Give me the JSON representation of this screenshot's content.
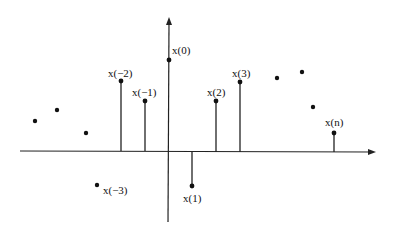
{
  "diagram": {
    "type": "discrete-time signal stem plot",
    "colors": {
      "ink": "#111111",
      "background": "#ffffff"
    },
    "axes": {
      "x_axis": {
        "y": 151,
        "x_start": 20,
        "x_end": 376,
        "arrow": true
      },
      "y_axis": {
        "x": 168,
        "y_start": 222,
        "y_end": 17,
        "arrow": true
      }
    },
    "labels": {
      "x0": "x(0)",
      "xm1": "x(−1)",
      "xm2": "x(−2)",
      "xm3": "x(−3)",
      "x1": "x(1)",
      "x2": "x(2)",
      "x3": "x(3)",
      "xn": "x(n)"
    },
    "samples": [
      {
        "name": "x(-2)",
        "x": 121,
        "y": 81,
        "stem": true
      },
      {
        "name": "x(-1)",
        "x": 145,
        "y": 101,
        "stem": true
      },
      {
        "name": "x(0)",
        "x": 169,
        "y": 60,
        "stem": false
      },
      {
        "name": "x(1)",
        "x": 192,
        "y": 186,
        "stem": true
      },
      {
        "name": "x(2)",
        "x": 216,
        "y": 101,
        "stem": true
      },
      {
        "name": "x(3)",
        "x": 240,
        "y": 82,
        "stem": true
      },
      {
        "name": "x(n)",
        "x": 334,
        "y": 133,
        "stem": true
      }
    ],
    "free_dots": [
      {
        "x": 35,
        "y": 121
      },
      {
        "x": 57,
        "y": 110
      },
      {
        "x": 86,
        "y": 133
      },
      {
        "x": 97,
        "y": 185
      },
      {
        "x": 277,
        "y": 78
      },
      {
        "x": 302,
        "y": 72
      },
      {
        "x": 313,
        "y": 107
      }
    ]
  }
}
